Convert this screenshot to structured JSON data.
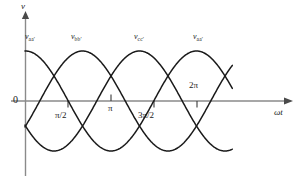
{
  "figure": {
    "axes": {
      "y_label": "v",
      "x_label_omega": "ω",
      "x_label_t": "t",
      "origin_label": "0"
    },
    "tick_labels": [
      "π/2",
      "π",
      "3π/2",
      "2π"
    ],
    "curve_labels": [
      {
        "symbol": "v",
        "subscript": "aa′"
      },
      {
        "symbol": "v",
        "subscript": "bb′"
      },
      {
        "symbol": "v",
        "subscript": "cc′"
      },
      {
        "symbol": "v",
        "subscript": "aa′"
      }
    ],
    "colors": {
      "curve": "#1a1a1a",
      "axis": "#7d7d7d",
      "text": "#1a1a1a",
      "background": "#ffffff"
    }
  },
  "chart_data": {
    "type": "line",
    "title": "",
    "xlabel": "ωt",
    "ylabel": "v",
    "x_tick_values": [
      1.5707963,
      3.1415927,
      4.712389,
      6.2831853
    ],
    "x_tick_labels": [
      "π/2",
      "π",
      "3π/2",
      "2π"
    ],
    "xlim": [
      0,
      7.6
    ],
    "ylim": [
      -1.25,
      1.25
    ],
    "grid": false,
    "legend": "inline-curve-labels",
    "amplitude": 1.0,
    "series": [
      {
        "name": "v_aa'",
        "label": "v_aa′",
        "phase_deg": 0,
        "form": "cos(wt)",
        "x": [
          0,
          0.3927,
          0.7854,
          1.1781,
          1.5708,
          1.9635,
          2.3562,
          2.7489,
          3.1416,
          3.5343,
          3.927,
          4.3197,
          4.7124,
          5.1051,
          5.4978,
          5.8905,
          6.2832,
          6.6759,
          7.0686,
          7.4613
        ],
        "values": [
          1.0,
          0.924,
          0.707,
          0.383,
          0.0,
          -0.383,
          -0.707,
          -0.924,
          -1.0,
          -0.924,
          -0.707,
          -0.383,
          0.0,
          0.383,
          0.707,
          0.924,
          1.0,
          0.924,
          0.707,
          0.383
        ]
      },
      {
        "name": "v_bb'",
        "label": "v_bb′",
        "phase_deg": -120,
        "form": "cos(wt - 120°)",
        "x": [
          0,
          0.3927,
          0.7854,
          1.1781,
          1.5708,
          1.9635,
          2.3562,
          2.7489,
          3.1416,
          3.5343,
          3.927,
          4.3197,
          4.7124,
          5.1051,
          5.4978,
          5.8905,
          6.2832,
          6.6759,
          7.0686,
          7.4613
        ],
        "values": [
          -0.5,
          -0.131,
          0.259,
          0.609,
          0.866,
          0.991,
          0.966,
          0.793,
          0.5,
          0.131,
          -0.259,
          -0.609,
          -0.866,
          -0.991,
          -0.966,
          -0.793,
          -0.5,
          -0.131,
          0.259,
          0.609
        ]
      },
      {
        "name": "v_cc'",
        "label": "v_cc′",
        "phase_deg": 120,
        "form": "cos(wt + 120°)",
        "x": [
          0,
          0.3927,
          0.7854,
          1.1781,
          1.5708,
          1.9635,
          2.3562,
          2.7489,
          3.1416,
          3.5343,
          3.927,
          4.3197,
          4.7124,
          5.1051,
          5.4978,
          5.8905,
          6.2832,
          6.6759,
          7.0686,
          7.4613
        ],
        "values": [
          -0.5,
          -0.793,
          -0.966,
          -0.991,
          -0.866,
          -0.609,
          -0.259,
          0.131,
          0.5,
          0.793,
          0.966,
          0.991,
          0.866,
          0.609,
          0.259,
          -0.131,
          -0.5,
          -0.793,
          -0.966,
          -0.991
        ]
      }
    ]
  }
}
